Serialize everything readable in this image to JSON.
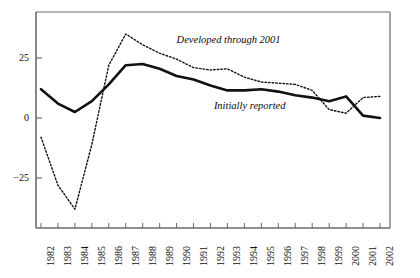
{
  "chart_data": {
    "type": "line",
    "title": "",
    "subtitle": "",
    "xlabel": "",
    "ylabel": "",
    "xlim": [
      1982,
      2002
    ],
    "ylim": [
      -42,
      40
    ],
    "grid": false,
    "legend_position": "inline-annotations",
    "y_ticks": [
      25,
      0,
      -25
    ],
    "y_tick_labels": [
      "25",
      "0",
      "−25"
    ],
    "x": [
      1982,
      1983,
      1984,
      1985,
      1986,
      1987,
      1988,
      1989,
      1990,
      1991,
      1992,
      1993,
      1994,
      1995,
      1996,
      1997,
      1998,
      1999,
      2000,
      2001,
      2002
    ],
    "x_tick_labels": [
      "1982",
      "1983",
      "1984",
      "1985",
      "1986",
      "1987",
      "1988",
      "1989",
      "1990",
      "1991",
      "1992",
      "1993",
      "1994",
      "1995",
      "1996",
      "1997",
      "1998",
      "1999",
      "2000",
      "2001",
      "2002"
    ],
    "series": [
      {
        "name": "Initially reported",
        "style": "solid",
        "color": "#111111",
        "width": 2.6,
        "values": [
          12.0,
          6.0,
          2.5,
          7.0,
          14.0,
          22.0,
          22.5,
          20.5,
          17.5,
          16.0,
          13.5,
          11.5,
          11.5,
          12.0,
          11.0,
          9.5,
          8.5,
          7.0,
          9.0,
          1.0,
          0.0
        ]
      },
      {
        "name": "Developed through 2001",
        "style": "dotted",
        "color": "#111111",
        "width": 1.4,
        "values": [
          -8.0,
          -28.0,
          -38.0,
          -11.0,
          22.0,
          35.0,
          30.5,
          27.0,
          24.5,
          21.0,
          20.0,
          20.5,
          17.0,
          15.0,
          14.5,
          14.0,
          11.5,
          3.5,
          2.0,
          8.5,
          9.0
        ]
      }
    ],
    "annotations": [
      {
        "text": "Developed through 2001",
        "x": 1990.0,
        "y": 32.0
      },
      {
        "text": "Initially reported",
        "x": 1992.2,
        "y": 4.5
      }
    ]
  },
  "axes": {
    "frame_color": "#6b6b6b",
    "tick_color": "#6b6b6b",
    "axis_line_color": "#6b6b6b"
  }
}
